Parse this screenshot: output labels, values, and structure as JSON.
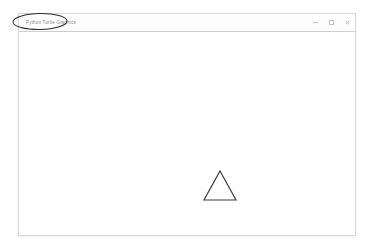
{
  "window": {
    "title": "Python Turtle Graphics",
    "controls": [
      {
        "name": "minimize",
        "label": "–"
      },
      {
        "name": "maximize",
        "label": "□"
      },
      {
        "name": "close",
        "label": "×"
      }
    ]
  },
  "canvas": {
    "background_color": "#ffffff",
    "shape": {
      "kind": "triangle",
      "stroke_color": "#3d3d3d",
      "fill": "none",
      "stroke_width": 1.2,
      "points": "200,137 216,166 184,166"
    }
  },
  "annotation": {
    "kind": "ellipse-highlight",
    "target": "window-title",
    "stroke_color": "#2b2b2b",
    "center_x": 40,
    "center_y": 21.5,
    "radius_x": 27,
    "radius_y": 8
  }
}
